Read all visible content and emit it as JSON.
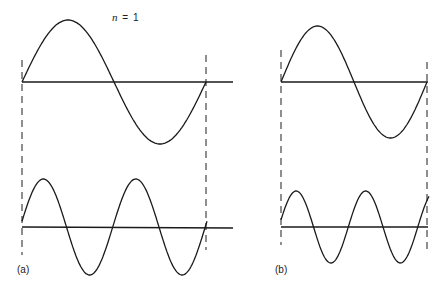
{
  "title_label": {
    "var": "n",
    "rest": " = 1"
  },
  "panels": [
    {
      "id": "a",
      "label": "(a)",
      "boundary_left_x": 22,
      "boundary_right_x": 206,
      "top_wave": {
        "description": "single full sine period between boundaries",
        "cycles": 1,
        "axis_y": 82,
        "amplitude": 62
      },
      "bottom_wave": {
        "description": "two full sine periods between boundaries",
        "cycles": 2,
        "axis_y": 227,
        "amplitude": 48
      }
    },
    {
      "id": "b",
      "label": "(b)",
      "boundary_left_x": 281,
      "boundary_right_x": 427,
      "top_wave": {
        "description": "single full sine period between boundaries",
        "cycles": 1,
        "axis_y": 82,
        "amplitude": 56
      },
      "bottom_wave": {
        "description": "sine of ~2.1 periods, phase-shifted, not fitting boundaries",
        "cycles": 2.1,
        "axis_y": 227,
        "amplitude": 36
      }
    }
  ],
  "colors": {
    "line": "#1a1a1a",
    "background": "#ffffff"
  }
}
